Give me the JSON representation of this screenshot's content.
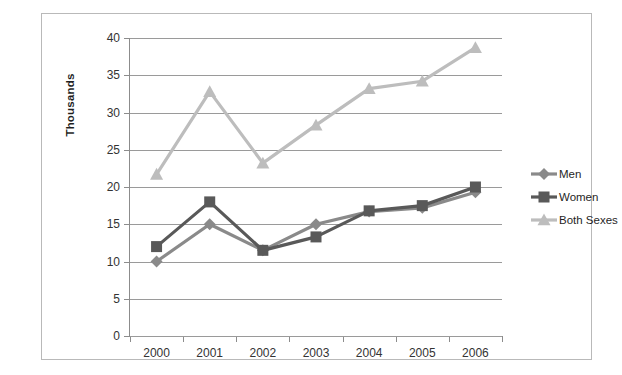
{
  "chart_data": {
    "type": "line",
    "title": "",
    "xlabel": "",
    "ylabel": "Thousands",
    "categories": [
      "2000",
      "2001",
      "2002",
      "2003",
      "2004",
      "2005",
      "2006"
    ],
    "ylim": [
      0,
      40
    ],
    "ytick_step": 5,
    "yticks": [
      "0",
      "5",
      "10",
      "15",
      "20",
      "25",
      "30",
      "35",
      "40"
    ],
    "grid": true,
    "legend_position": "right",
    "series": [
      {
        "name": "Men",
        "color": "#8a8a8a",
        "marker": "diamond",
        "values": [
          10,
          15,
          11.5,
          15,
          16.7,
          17.2,
          19.3
        ]
      },
      {
        "name": "Women",
        "color": "#595959",
        "marker": "square",
        "values": [
          12,
          18,
          11.5,
          13.3,
          16.8,
          17.5,
          20
        ]
      },
      {
        "name": "Both Sexes",
        "color": "#bdbdbd",
        "marker": "triangle",
        "values": [
          21.7,
          32.8,
          23.2,
          28.3,
          33.2,
          34.2,
          38.7
        ]
      }
    ]
  },
  "axis": {
    "y_title": "Thousands"
  },
  "legend": {
    "entries": [
      {
        "label": "Men"
      },
      {
        "label": "Women"
      },
      {
        "label": "Both Sexes"
      }
    ]
  },
  "colors": {
    "men": "#8a8a8a",
    "women": "#595959",
    "both": "#bdbdbd",
    "grid": "#9a9a9a",
    "axis": "#8c8c8c",
    "border": "#b9b9b9"
  }
}
